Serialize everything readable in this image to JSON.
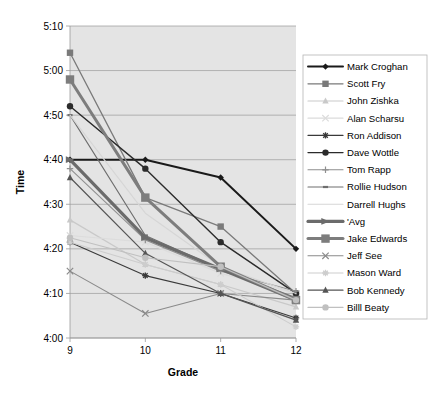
{
  "chart_data": {
    "type": "line",
    "title": "",
    "xlabel": "Grade",
    "ylabel": "Time",
    "categories": [
      "9",
      "10",
      "11",
      "12"
    ],
    "x": [
      9,
      10,
      11,
      12
    ],
    "xlim": [
      9,
      12
    ],
    "ylim": [
      "4:00",
      "5:10"
    ],
    "ytick_labels": [
      "5:10",
      "5:00",
      "4:50",
      "4:40",
      "4:30",
      "4:20",
      "4:10",
      "4:00"
    ],
    "ytick_values": [
      310,
      300,
      290,
      280,
      270,
      260,
      250,
      240
    ],
    "grid": true,
    "legend_position": "right",
    "plot_background": "#e4e4e4",
    "series": [
      {
        "name": "Mark Croghan",
        "color": "#1a1a1a",
        "marker": "diamond",
        "width": 2.0,
        "values": [
          "4:40",
          "4:40",
          "4:36",
          "4:20"
        ],
        "minutes": [
          280.0,
          280.0,
          276.0,
          260.0
        ]
      },
      {
        "name": "Scott Fry",
        "color": "#7a7a7a",
        "marker": "square",
        "width": 1.3,
        "values": [
          "5:04",
          "4:31.5",
          "4:25",
          "4:10"
        ],
        "minutes": [
          304.0,
          271.5,
          265.0,
          250.0
        ]
      },
      {
        "name": "John Zishka",
        "color": "#c9c9c9",
        "marker": "triangle",
        "width": 1.2,
        "values": [
          "4:26.5",
          "4:16.5",
          "4:12",
          "4:07"
        ],
        "minutes": [
          266.5,
          256.5,
          252.0,
          247.0
        ]
      },
      {
        "name": "Alan Scharsu",
        "color": "#dcdcdc",
        "marker": "cross",
        "width": 1.2,
        "values": [
          "4:23",
          "4:21.5",
          "4:14.5",
          "4:10"
        ],
        "minutes": [
          263.0,
          261.5,
          254.5,
          250.0
        ]
      },
      {
        "name": "Ron Addison",
        "color": "#3a3a3a",
        "marker": "star",
        "width": 1.1,
        "values": [
          "4:21.5",
          "4:14",
          "4:10",
          "4:04.5"
        ],
        "minutes": [
          261.5,
          254.0,
          250.0,
          244.5
        ]
      },
      {
        "name": "Dave Wottle",
        "color": "#2b2b2b",
        "marker": "circle",
        "width": 1.4,
        "values": [
          "4:52",
          "4:38",
          "4:21.5",
          "4:10"
        ],
        "minutes": [
          292.0,
          278.0,
          261.5,
          250.0
        ]
      },
      {
        "name": "Tom Rapp",
        "color": "#8f8f8f",
        "marker": "plus",
        "width": 1.1,
        "values": [
          "4:38",
          "4:22",
          "4:15",
          "4:10.5"
        ],
        "minutes": [
          278.0,
          262.0,
          255.0,
          250.5
        ]
      },
      {
        "name": "Rollie Hudson",
        "color": "#6e6e6e",
        "marker": "smalldash",
        "width": 1.1,
        "values": [
          "4:50",
          "4:23",
          "4:15.5",
          "4:09"
        ],
        "minutes": [
          290.0,
          263.0,
          255.5,
          249.0
        ]
      },
      {
        "name": "Darrell Hughs",
        "color": "#d6d6d6",
        "marker": "none",
        "width": 1.1,
        "values": [
          "4:50",
          "4:28",
          "4:16",
          "4:10"
        ],
        "minutes": [
          290.0,
          268.0,
          256.0,
          250.0
        ]
      },
      {
        "name": "'Avg",
        "color": "#6b6b6b",
        "marker": "arrow",
        "width": 3.2,
        "values": [
          "4:40",
          "4:22.5",
          "4:15.5",
          "4:08.5"
        ],
        "minutes": [
          280.0,
          262.5,
          255.5,
          248.5
        ]
      },
      {
        "name": "Jake Edwards",
        "color": "#7d7d7d",
        "marker": "square",
        "width": 3.0,
        "values": [
          "4:98",
          "4:31.5",
          "4:16",
          "4:08.5"
        ],
        "minutes": [
          298.0,
          271.5,
          256.0,
          248.5
        ]
      },
      {
        "name": "Jeff See",
        "color": "#8a8a8a",
        "marker": "x",
        "width": 1.1,
        "values": [
          "4:15",
          "4:05.5",
          "4:10",
          "4:08.5"
        ],
        "minutes": [
          255.0,
          245.5,
          250.0,
          248.5
        ]
      },
      {
        "name": "Mason Ward",
        "color": "#cdcdcd",
        "marker": "star",
        "width": 1.1,
        "values": [
          "4:21.5",
          "4:16.5",
          "4:12",
          "4:02.5"
        ],
        "minutes": [
          261.5,
          256.5,
          252.0,
          242.5
        ]
      },
      {
        "name": "Bob Kennedy",
        "color": "#555555",
        "marker": "triangle",
        "width": 1.2,
        "values": [
          "4:36",
          "4:19",
          "4:10",
          "4:04"
        ],
        "minutes": [
          276.0,
          259.0,
          250.0,
          244.0
        ]
      },
      {
        "name": "Billl Beaty",
        "color": "#c0c0c0",
        "marker": "circle",
        "width": 1.2,
        "values": [
          "4:22.5",
          "4:18",
          "4:16",
          "4:08.5"
        ],
        "minutes": [
          262.5,
          258.0,
          256.0,
          248.5
        ]
      }
    ]
  },
  "axes": {
    "y_title": "Time",
    "x_title": "Grade"
  }
}
